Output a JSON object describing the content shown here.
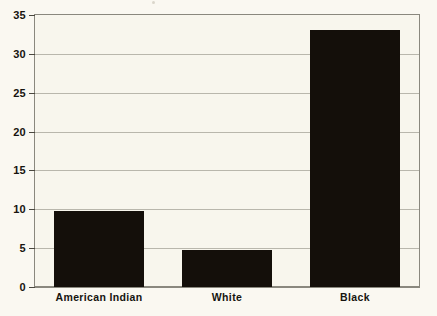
{
  "chart_data": {
    "type": "bar",
    "title": "",
    "subtitle": "",
    "xlabel": "",
    "ylabel": "",
    "categories": [
      "American Indian",
      "White",
      "Black"
    ],
    "values": [
      9.8,
      4.7,
      33.1
    ],
    "series": [
      {
        "name": "",
        "values": [
          9.8,
          4.7,
          33.1
        ]
      }
    ],
    "ylim": [
      0,
      35
    ],
    "yticks": [
      0,
      5,
      10,
      15,
      20,
      25,
      30,
      35
    ],
    "ytick_labels": [
      "0",
      "5",
      "10",
      "15",
      "20",
      "25",
      "30",
      "35"
    ],
    "grid": true,
    "grid_axis": "y",
    "legend": false,
    "legend_position": "none",
    "bar_color": "#140f0a",
    "plot_background": "#f8f6ed",
    "gridline_color": "#b9b7ac",
    "frame_color": "#8a887e",
    "text_color": "#16140f",
    "annotations": []
  }
}
